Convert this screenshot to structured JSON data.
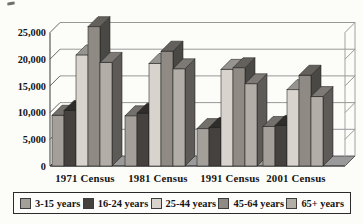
{
  "chart_data": {
    "type": "bar",
    "projection": "3d-clustered-column",
    "title": "",
    "categories": [
      "1971 Census",
      "1981 Census",
      "1991 Census",
      "2001 Census"
    ],
    "series": [
      {
        "name": "3-15 years",
        "color": "#a49f99",
        "values": [
          9500,
          9400,
          7000,
          7400
        ]
      },
      {
        "name": "16-24 years",
        "color": "#45413e",
        "values": [
          10400,
          9900,
          7200,
          7600
        ]
      },
      {
        "name": "25-44 years",
        "color": "#d8d4cd",
        "values": [
          20800,
          19200,
          18100,
          14300
        ]
      },
      {
        "name": "45-64 years",
        "color": "#8f8a84",
        "values": [
          26100,
          21500,
          18400,
          17000
        ]
      },
      {
        "name": "65+ years",
        "color": "#b2ada7",
        "values": [
          19400,
          18200,
          15400,
          13000
        ]
      }
    ],
    "xlabel": "",
    "ylabel": "",
    "ylim": [
      0,
      25000
    ],
    "yticks": [
      0,
      5000,
      10000,
      15000,
      20000,
      25000
    ],
    "ytick_labels": [
      "0",
      "5,000",
      "10,000",
      "15,000",
      "20,000",
      "25,000"
    ],
    "grid": true,
    "legend_position": "bottom"
  }
}
